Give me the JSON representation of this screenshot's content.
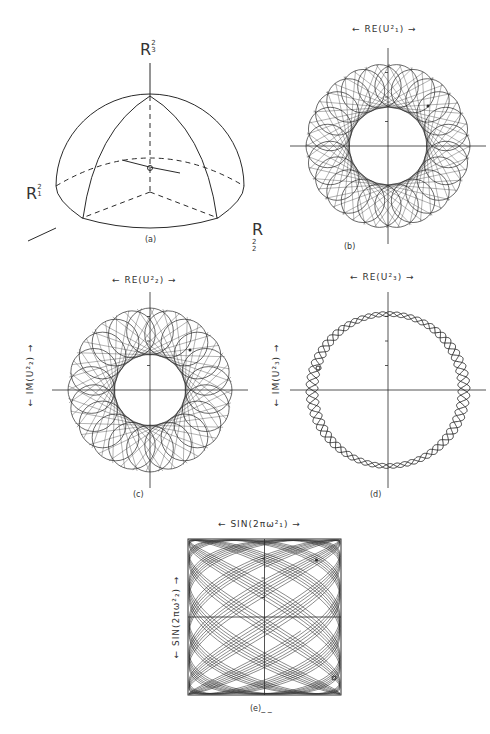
{
  "figure": {
    "panels": [
      {
        "id": "a",
        "caption": "(a)",
        "type": "hemisphere-diagram",
        "axes": {
          "top": {
            "base": "R",
            "sup": "2",
            "sub": "3"
          },
          "left": {
            "base": "R",
            "sup": "2",
            "sub": "1"
          },
          "right": {
            "base": "R",
            "sup": "2",
            "sub": "2"
          }
        }
      },
      {
        "id": "b",
        "caption": "(b)",
        "type": "phase-portrait",
        "xlabel": "← RE(U²₁) →",
        "ylabel": "",
        "petals": 22,
        "inner_radius_ratio": 0.47
      },
      {
        "id": "c",
        "caption": "(c)",
        "type": "phase-portrait",
        "xlabel": "← RE(U²₂) →",
        "ylabel": "← IM(U²₂) →",
        "petals": 20,
        "inner_radius_ratio": 0.43
      },
      {
        "id": "d",
        "caption": "(d)",
        "type": "phase-portrait",
        "xlabel": "← RE(U²₃) →",
        "ylabel": "← IM(U²₃) →",
        "waves": 22,
        "ring_ratio": 0.9
      },
      {
        "id": "e",
        "caption": "(e)_ _",
        "type": "torus-projection",
        "xlabel": "← SIN(2πω²₁) →",
        "ylabel": "← SIN(2πω²₂) →"
      }
    ]
  },
  "chart_data": [
    {
      "type": "scatter",
      "title": "(b)",
      "xlabel": "RE(U^2_1)",
      "ylabel": "",
      "shape": "rosette annulus",
      "grid": false
    },
    {
      "type": "scatter",
      "title": "(c)",
      "xlabel": "RE(U^2_2)",
      "ylabel": "IM(U^2_2)",
      "shape": "rosette annulus",
      "grid": false
    },
    {
      "type": "scatter",
      "title": "(d)",
      "xlabel": "RE(U^2_3)",
      "ylabel": "IM(U^2_3)",
      "shape": "thin braided ring",
      "grid": false
    },
    {
      "type": "line",
      "title": "(e)",
      "xlabel": "SIN(2πω^2_1)",
      "ylabel": "SIN(2πω^2_2)",
      "shape": "dense quasi-periodic trajectory filling square",
      "xlim": [
        -1,
        1
      ],
      "ylim": [
        -1,
        1
      ],
      "grid": false
    }
  ],
  "style": {
    "ink": "#2a2a2a",
    "paper": "#ffffff"
  }
}
